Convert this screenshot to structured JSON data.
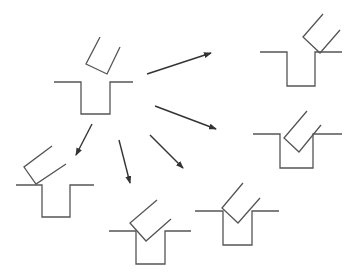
{
  "diagram": {
    "width": 356,
    "height": 279,
    "colors": {
      "stroke": "#555555",
      "arrow": "#333333",
      "background": "#ffffff"
    },
    "stroke_width": 1.3,
    "arrow_width": 1.4,
    "source": {
      "id": "center",
      "slot": [
        [
          54,
          82
        ],
        [
          81,
          82
        ],
        [
          81,
          114
        ],
        [
          110,
          114
        ],
        [
          110,
          82
        ],
        [
          133,
          82
        ]
      ],
      "piece": [
        [
          100,
          37
        ],
        [
          86,
          64
        ],
        [
          107,
          74
        ],
        [
          120,
          47
        ]
      ]
    },
    "outcomes": [
      {
        "id": "top-right",
        "slot": [
          [
            260,
            52
          ],
          [
            287,
            52
          ],
          [
            287,
            86
          ],
          [
            315,
            86
          ],
          [
            315,
            52
          ],
          [
            342,
            52
          ]
        ],
        "piece": [
          [
            323,
            14
          ],
          [
            303,
            37
          ],
          [
            320,
            53
          ],
          [
            340,
            30
          ]
        ]
      },
      {
        "id": "right-middle",
        "slot": [
          [
            253,
            134
          ],
          [
            280,
            134
          ],
          [
            280,
            168
          ],
          [
            313,
            168
          ],
          [
            313,
            134
          ],
          [
            342,
            134
          ]
        ],
        "piece": [
          [
            307,
            111
          ],
          [
            284,
            138
          ],
          [
            299,
            152
          ],
          [
            321,
            125
          ]
        ]
      },
      {
        "id": "left",
        "slot": [
          [
            16,
            185
          ],
          [
            42,
            185
          ],
          [
            42,
            217
          ],
          [
            70,
            217
          ],
          [
            70,
            185
          ],
          [
            94,
            185
          ]
        ],
        "piece": [
          [
            52,
            146
          ],
          [
            24,
            167
          ],
          [
            36,
            184
          ],
          [
            66,
            164
          ]
        ]
      },
      {
        "id": "bottom-center",
        "slot": [
          [
            109,
            231
          ],
          [
            136,
            231
          ],
          [
            136,
            264
          ],
          [
            165,
            264
          ],
          [
            165,
            231
          ],
          [
            191,
            231
          ]
        ],
        "piece": [
          [
            157,
            200
          ],
          [
            130,
            223
          ],
          [
            146,
            241
          ],
          [
            171,
            219
          ]
        ]
      },
      {
        "id": "bottom-right",
        "slot": [
          [
            195,
            211
          ],
          [
            223,
            211
          ],
          [
            223,
            245
          ],
          [
            252,
            245
          ],
          [
            252,
            211
          ],
          [
            279,
            211
          ]
        ],
        "piece": [
          [
            243,
            183
          ],
          [
            222,
            208
          ],
          [
            238,
            223
          ],
          [
            260,
            198
          ]
        ]
      }
    ],
    "arrows": [
      {
        "id": "to-top-right",
        "from": [
          147,
          74
        ],
        "to": [
          211,
          53
        ]
      },
      {
        "id": "to-right-middle",
        "from": [
          155,
          106
        ],
        "to": [
          216,
          129
        ]
      },
      {
        "id": "to-left",
        "from": [
          92,
          124
        ],
        "to": [
          76,
          155
        ]
      },
      {
        "id": "to-bottom-center",
        "from": [
          119,
          140
        ],
        "to": [
          130,
          183
        ]
      },
      {
        "id": "to-bottom-right",
        "from": [
          150,
          135
        ],
        "to": [
          183,
          168
        ]
      }
    ]
  }
}
